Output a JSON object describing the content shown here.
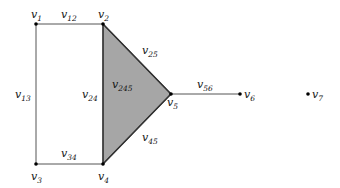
{
  "diagram": {
    "colors": {
      "edge": "#555555",
      "vertex": "#000000",
      "face_fill": "#a6a6a6",
      "face_stroke": "#333333",
      "background": "#ffffff"
    },
    "vertices": [
      {
        "id": "v1",
        "base": "v",
        "sub": "1",
        "x": 36,
        "y": 24,
        "label_x": 31,
        "label_y": 18
      },
      {
        "id": "v2",
        "base": "v",
        "sub": "2",
        "x": 103,
        "y": 24,
        "label_x": 98,
        "label_y": 18
      },
      {
        "id": "v3",
        "base": "v",
        "sub": "3",
        "x": 36,
        "y": 164,
        "label_x": 31,
        "label_y": 180
      },
      {
        "id": "v4",
        "base": "v",
        "sub": "4",
        "x": 103,
        "y": 164,
        "label_x": 98,
        "label_y": 180
      },
      {
        "id": "v5",
        "base": "v",
        "sub": "5",
        "x": 171,
        "y": 94,
        "label_x": 167,
        "label_y": 106
      },
      {
        "id": "v6",
        "base": "v",
        "sub": "6",
        "x": 240,
        "y": 94,
        "label_x": 244,
        "label_y": 98
      },
      {
        "id": "v7",
        "base": "v",
        "sub": "7",
        "x": 308,
        "y": 94,
        "label_x": 312,
        "label_y": 98
      }
    ],
    "edges": [
      {
        "id": "v12",
        "base": "v",
        "sub": "12",
        "from": "v1",
        "to": "v2",
        "label_x": 61,
        "label_y": 18
      },
      {
        "id": "v13",
        "base": "v",
        "sub": "13",
        "from": "v1",
        "to": "v3",
        "label_x": 15,
        "label_y": 98
      },
      {
        "id": "v24",
        "base": "v",
        "sub": "24",
        "from": "v2",
        "to": "v4",
        "label_x": 82,
        "label_y": 98
      },
      {
        "id": "v34",
        "base": "v",
        "sub": "34",
        "from": "v3",
        "to": "v4",
        "label_x": 61,
        "label_y": 157
      },
      {
        "id": "v25",
        "base": "v",
        "sub": "25",
        "from": "v2",
        "to": "v5",
        "label_x": 142,
        "label_y": 54
      },
      {
        "id": "v45",
        "base": "v",
        "sub": "45",
        "from": "v4",
        "to": "v5",
        "label_x": 142,
        "label_y": 141
      },
      {
        "id": "v56",
        "base": "v",
        "sub": "56",
        "from": "v5",
        "to": "v6",
        "label_x": 197,
        "label_y": 88
      }
    ],
    "faces": [
      {
        "id": "v245",
        "base": "v",
        "sub": "245",
        "vertices": [
          "v2",
          "v4",
          "v5"
        ],
        "label_x": 112,
        "label_y": 88
      }
    ]
  }
}
